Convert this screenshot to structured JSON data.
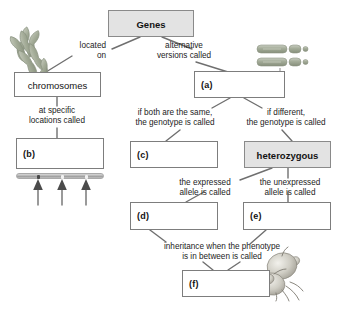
{
  "diagram": {
    "nodes": [
      {
        "id": "genes",
        "label": "Genes",
        "kind": "shaded"
      },
      {
        "id": "chromosomes",
        "label": "chromosomes",
        "kind": "term"
      },
      {
        "id": "a",
        "label": "(a)",
        "kind": "blank"
      },
      {
        "id": "b",
        "label": "(b)",
        "kind": "blank"
      },
      {
        "id": "c",
        "label": "(c)",
        "kind": "blank"
      },
      {
        "id": "heterozygous",
        "label": "heterozygous",
        "kind": "shaded"
      },
      {
        "id": "d",
        "label": "(d)",
        "kind": "blank"
      },
      {
        "id": "e",
        "label": "(e)",
        "kind": "blank"
      },
      {
        "id": "f",
        "label": "(f)",
        "kind": "blank"
      }
    ],
    "edge_labels": [
      {
        "id": "located-on",
        "text": "located\non"
      },
      {
        "id": "alternative-versions",
        "text": "alternative\nversions called"
      },
      {
        "id": "at-specific-locations",
        "text": "at specific\nlocations called"
      },
      {
        "id": "if-both-same",
        "text": "if both are the same,\nthe genotype is called"
      },
      {
        "id": "if-different",
        "text": "if different,\nthe genotype is called"
      },
      {
        "id": "expressed-allele",
        "text": "the expressed\nallele is called"
      },
      {
        "id": "unexpressed-allele",
        "text": "the unexpressed\nallele is called"
      },
      {
        "id": "inheritance-between",
        "text": "inheritance when the phenotype\nis in between is called"
      }
    ],
    "illustrations": [
      {
        "id": "chromosome-cluster",
        "caption": "chromosomes"
      },
      {
        "id": "homologous-chromosomes",
        "caption": "allele pair"
      },
      {
        "id": "gene-locus-bar",
        "caption": "gene loci on chromosome"
      },
      {
        "id": "locus-arrows",
        "caption": "three loci"
      },
      {
        "id": "flower",
        "caption": "flower"
      }
    ],
    "colors": {
      "box_border": "#7d7d7d",
      "box_fill": "#ffffff",
      "shaded_fill": "#e3e3e3",
      "wire": "#6f6f6f",
      "text": "#131313",
      "chromosome": "#9aa392"
    }
  }
}
